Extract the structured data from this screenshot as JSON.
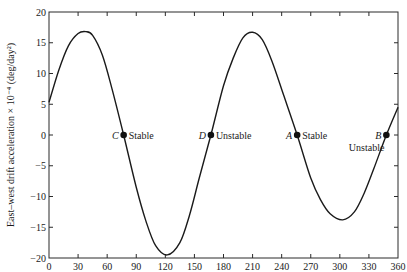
{
  "chart_data": {
    "type": "line",
    "title": "",
    "xlabel": "",
    "ylabel": "East–west drift acceleration × 10⁻⁴ (deg/day²)",
    "xlim": [
      0,
      360
    ],
    "ylim": [
      -20,
      20
    ],
    "xticks": [
      0,
      30,
      60,
      90,
      120,
      150,
      180,
      210,
      240,
      270,
      300,
      330,
      360
    ],
    "yticks": [
      20,
      15,
      10,
      5,
      0,
      -5,
      -10,
      -15,
      -20
    ],
    "ytick_labels": [
      "20",
      "15",
      "10",
      "5",
      "0",
      "−5",
      "−10",
      "−15",
      "−20"
    ],
    "grid": false,
    "legend": null,
    "series": [
      {
        "name": "acceleration",
        "x": [
          0,
          10,
          20,
          30,
          38,
          45,
          55,
          65,
          77,
          90,
          100,
          110,
          122,
          135,
          145,
          155,
          167,
          180,
          190,
          200,
          210,
          220,
          230,
          242,
          256,
          270,
          280,
          290,
          303,
          315,
          325,
          335,
          348,
          360
        ],
        "y": [
          5.3,
          10.5,
          14.5,
          16.5,
          16.8,
          16.2,
          13.0,
          7.5,
          0,
          -8.5,
          -14.0,
          -18.0,
          -19.5,
          -17.5,
          -13.0,
          -7.0,
          0,
          8.0,
          12.5,
          15.8,
          16.7,
          15.5,
          12.0,
          6.5,
          0,
          -7.0,
          -10.5,
          -12.8,
          -13.8,
          -12.5,
          -9.5,
          -5.5,
          0,
          4.5
        ]
      }
    ],
    "points": [
      {
        "label": "C",
        "x": 77,
        "y": 0,
        "status": "Stable"
      },
      {
        "label": "D",
        "x": 167,
        "y": 0,
        "status": "Unstable"
      },
      {
        "label": "A",
        "x": 256,
        "y": 0,
        "status": "Stable"
      },
      {
        "label": "B",
        "x": 348,
        "y": 0,
        "status": "Unstable"
      }
    ]
  },
  "labels": {
    "ylabel": "East–west drift acceleration × 10⁻⁴ (deg/day²)",
    "pointC": "C",
    "pointC_status": "Stable",
    "pointD": "D",
    "pointD_status": "Unstable",
    "pointA": "A",
    "pointA_status": "Stable",
    "pointB": "B",
    "pointB_status": "Unstable"
  }
}
